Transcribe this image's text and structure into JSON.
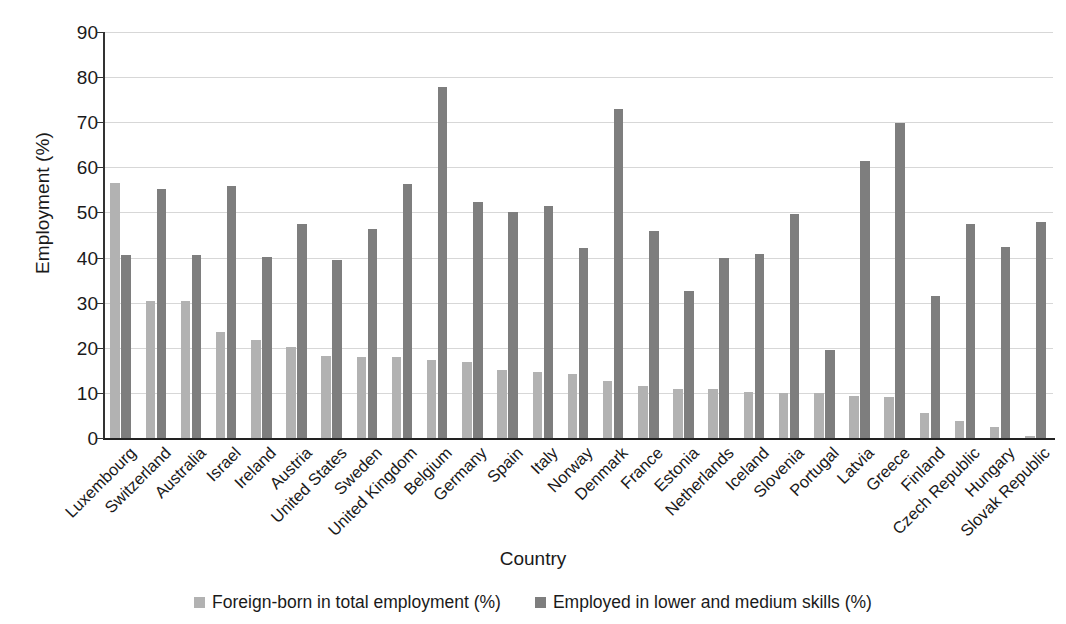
{
  "chart_data": {
    "type": "bar",
    "title": "",
    "xlabel": "Country",
    "ylabel": "Employment (%)",
    "ylim": [
      0,
      90
    ],
    "ytick_step": 10,
    "yticks": [
      90,
      80,
      70,
      60,
      50,
      40,
      30,
      20,
      10,
      0
    ],
    "grid": true,
    "legend_position": "bottom",
    "colors": {
      "series_0": "#b2b2b2",
      "series_1": "#7e7e7e",
      "gridline": "#d7d7d7",
      "axis": "#222222",
      "text": "#1a1a1a",
      "background": "#ffffff"
    },
    "categories": [
      "Luxembourg",
      "Switzerland",
      "Australia",
      "Israel",
      "Ireland",
      "Austria",
      "United States",
      "Sweden",
      "United Kingdom",
      "Belgium",
      "Germany",
      "Spain",
      "Italy",
      "Norway",
      "Denmark",
      "France",
      "Estonia",
      "Netherlands",
      "Iceland",
      "Slovenia",
      "Portugal",
      "Latvia",
      "Greece",
      "Finland",
      "Czech Republic",
      "Hungary",
      "Slovak Republic"
    ],
    "series": [
      {
        "name": "Foreign-born in total employment (%)",
        "color": "#b2b2b2",
        "values": [
          56.5,
          30.4,
          30.4,
          23.5,
          21.8,
          20.1,
          18.2,
          18.0,
          17.9,
          17.2,
          16.9,
          15.1,
          14.6,
          14.1,
          12.6,
          11.6,
          10.8,
          10.8,
          10.3,
          10.0,
          9.9,
          9.4,
          9.0,
          5.6,
          3.7,
          2.5,
          0.5
        ]
      },
      {
        "name": "Employed in lower and medium skills (%)",
        "color": "#7e7e7e",
        "values": [
          40.5,
          55.1,
          40.6,
          55.8,
          40.1,
          47.5,
          39.4,
          46.3,
          56.4,
          77.8,
          52.3,
          50.1,
          51.5,
          42.1,
          73.0,
          46.0,
          32.7,
          39.8,
          40.9,
          49.7,
          19.6,
          61.3,
          69.9,
          31.5,
          47.5,
          42.3,
          47.9
        ]
      }
    ]
  },
  "axis": {
    "y_title": "Employment (%)",
    "x_title": "Country"
  },
  "legend": {
    "items": [
      {
        "label": "Foreign-born in total employment (%)",
        "swatch": "legend-swatch-light"
      },
      {
        "label": "Employed in lower and medium skills (%)",
        "swatch": "legend-swatch-dark"
      }
    ]
  }
}
